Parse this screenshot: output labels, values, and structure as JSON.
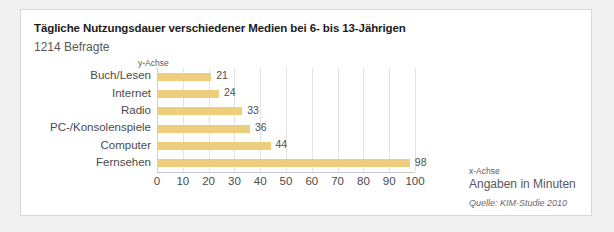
{
  "card": {
    "title": "Tägliche Nutzungsdauer verschiedener Medien bei 6- bis 13-Jährigen",
    "subtitle": "1214 Befragte",
    "y_axis_caption": "y-Achse",
    "x_axis_caption": "x-Achse",
    "x_axis_unit": "Angaben in Minuten",
    "source": "Quelle: KIM-Studie 2010"
  },
  "colors": {
    "bar": "#edce7c",
    "gridline": "#e3e3e3",
    "axis": "#c8c8c8",
    "card_background": "#ffffff",
    "page_background": "#f1f1f1",
    "title_text": "#1b1b1b",
    "label_text": "#4a4b4d"
  },
  "chart_data": {
    "type": "bar",
    "orientation": "horizontal",
    "title": "Tägliche Nutzungsdauer verschiedener Medien bei 6- bis 13-Jährigen",
    "subtitle": "1214 Befragte",
    "categories": [
      "Buch/Lesen",
      "Internet",
      "Radio",
      "PC-/Konsolenspiele",
      "Computer",
      "Fernsehen"
    ],
    "values": [
      21,
      24,
      33,
      36,
      44,
      98
    ],
    "value_labels": [
      "21",
      "24",
      "33",
      "36",
      "44",
      "98"
    ],
    "xlabel": "Angaben in Minuten",
    "ylabel": "y-Achse",
    "xlim": [
      0,
      100
    ],
    "xticks": [
      0,
      10,
      20,
      30,
      40,
      50,
      60,
      70,
      80,
      90,
      100
    ],
    "xtick_labels": [
      "0",
      "10",
      "20",
      "30",
      "40",
      "50",
      "60",
      "70",
      "80",
      "90",
      "100"
    ],
    "grid": "vertical",
    "legend": "none",
    "annotations": [
      "x-Achse",
      "y-Achse",
      "Quelle: KIM-Studie 2010"
    ]
  }
}
